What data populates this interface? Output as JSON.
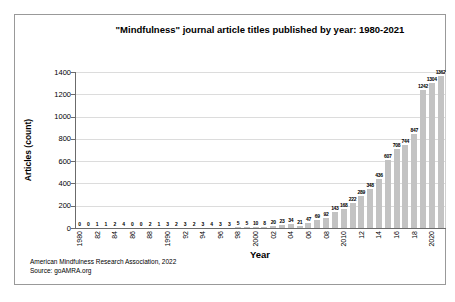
{
  "figure": {
    "attribution_line1": "American Mindfulness Research Association, 2022",
    "attribution_line2": "Source: goAMRA.org"
  },
  "chart_data": {
    "type": "bar",
    "title": "\"Mindfulness\" journal article titles published by year: 1980-2021",
    "xlabel": "Year",
    "ylabel": "Articles (count)",
    "categories": [
      1980,
      1981,
      1982,
      1983,
      1984,
      1985,
      1986,
      1987,
      1988,
      1989,
      1990,
      1991,
      1992,
      1993,
      1994,
      1995,
      1996,
      1997,
      1998,
      1999,
      2000,
      2001,
      2002,
      2003,
      2004,
      2005,
      2006,
      2007,
      2008,
      2009,
      2010,
      2011,
      2012,
      2013,
      2014,
      2015,
      2016,
      2017,
      2018,
      2019,
      2020,
      2021
    ],
    "values": [
      0,
      0,
      1,
      1,
      2,
      4,
      0,
      0,
      2,
      1,
      3,
      2,
      3,
      2,
      3,
      4,
      3,
      3,
      5,
      5,
      10,
      8,
      20,
      23,
      34,
      21,
      47,
      69,
      92,
      143,
      168,
      222,
      289,
      348,
      436,
      607,
      708,
      744,
      847,
      1242,
      1304,
      1362
    ],
    "x_tick_labels": [
      "1980",
      "82",
      "84",
      "86",
      "88",
      "1990",
      "92",
      "94",
      "96",
      "98",
      "2000",
      "02",
      "04",
      "06",
      "08",
      "2010",
      "12",
      "14",
      "16",
      "18",
      "2020"
    ],
    "x_tick_every": 2,
    "y_tick_labels": [
      "0",
      "200",
      "400",
      "600",
      "800",
      "1000",
      "1200",
      "1400"
    ],
    "ylim": [
      0,
      1400
    ],
    "ytick_step": 200,
    "grid": true,
    "legend": false,
    "data_labels": true,
    "bar_color": "#c3c3c3",
    "gridline_color": "#dcdcdc",
    "axis_color": "#6b6b6b"
  }
}
